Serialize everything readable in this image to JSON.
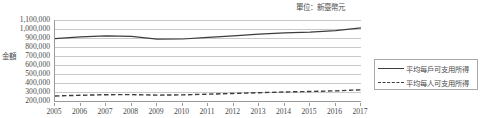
{
  "unit_note": "單位：新臺幣元",
  "axis": {
    "y_title": "金額",
    "y_ticks": [
      "1,100,000",
      "1,000,000",
      "900,000",
      "800,000",
      "700,000",
      "600,000",
      "500,000",
      "400,000",
      "300,000",
      "200,000"
    ],
    "x_ticks": [
      "2005",
      "2006",
      "2007",
      "2008",
      "2009",
      "2010",
      "2011",
      "2012",
      "2013",
      "2014",
      "2015",
      "2016",
      "2017"
    ]
  },
  "legend": {
    "items": [
      {
        "label": "平均每戶可支用所得",
        "style": "solid",
        "color": "#3d3d3d"
      },
      {
        "label": "平均每人可支用所得",
        "style": "dashed",
        "color": "#3d3d3d"
      }
    ]
  },
  "chart_data": {
    "type": "line",
    "title": "",
    "subtitle": "",
    "xlabel": "",
    "ylabel": "金額",
    "unit": "新臺幣元",
    "grid": true,
    "legend_position": "right",
    "ylim": [
      200000,
      1100000
    ],
    "ytick_step": 100000,
    "categories": [
      "2005",
      "2006",
      "2007",
      "2008",
      "2009",
      "2010",
      "2011",
      "2012",
      "2013",
      "2014",
      "2015",
      "2016",
      "2017"
    ],
    "series": [
      {
        "name": "平均每戶可支用所得",
        "style": "solid",
        "color": "#3d3d3d",
        "values": [
          894000,
          913000,
          923000,
          919000,
          888000,
          889000,
          907000,
          923000,
          942000,
          957000,
          966000,
          983000,
          1013000
        ]
      },
      {
        "name": "平均每人可支用所得",
        "style": "dashed",
        "color": "#3d3d3d",
        "values": [
          256000,
          264000,
          270000,
          271000,
          265000,
          268000,
          276000,
          284000,
          292000,
          300000,
          306000,
          313000,
          324000
        ]
      }
    ]
  }
}
